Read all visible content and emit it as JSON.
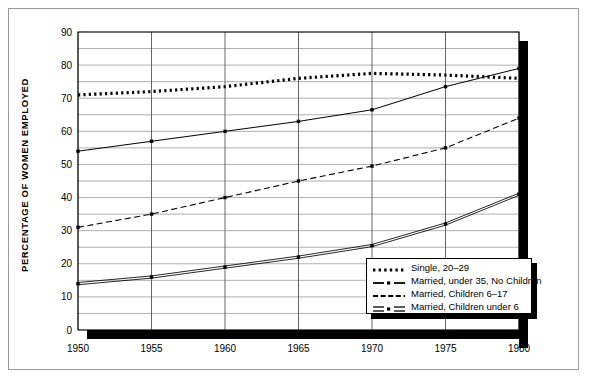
{
  "chart_data": {
    "type": "line",
    "title": "",
    "xlabel": "",
    "ylabel": "PERCENTAGE OF WOMEN EMPLOYED",
    "x": [
      1950,
      1955,
      1960,
      1965,
      1970,
      1975,
      1980
    ],
    "xlim": [
      1950,
      1980
    ],
    "ylim": [
      0,
      90
    ],
    "x_ticks": [
      "1950",
      "1955",
      "1960",
      "1965",
      "1970",
      "1975",
      "1980"
    ],
    "y_ticks": [
      "0",
      "10",
      "20",
      "30",
      "40",
      "50",
      "60",
      "70",
      "80",
      "90"
    ],
    "y_minor_step": 5,
    "grid": true,
    "legend_position": "lower-right",
    "series": [
      {
        "name": "Single, 20–29",
        "style": "dotted",
        "values": [
          71,
          72,
          73.5,
          76,
          77.5,
          77,
          76
        ]
      },
      {
        "name": "Married, under 35, No Children",
        "style": "dash-dot",
        "values": [
          54,
          57,
          60,
          63,
          66.5,
          73.5,
          79
        ]
      },
      {
        "name": "Married, Children 6–17",
        "style": "dashed",
        "values": [
          31,
          35,
          40,
          45,
          49.5,
          55,
          64
        ]
      },
      {
        "name": "Married, Children under 6",
        "style": "double-dot",
        "values": [
          14,
          16,
          19,
          22,
          25.5,
          32,
          41
        ]
      }
    ]
  },
  "legend": {
    "items": [
      {
        "label": "Single, 20–29",
        "key": "dotted"
      },
      {
        "label": "Married, under 35, No Children",
        "key": "dash-dot"
      },
      {
        "label": "Married, Children 6–17",
        "key": "dashed"
      },
      {
        "label": "Married, Children under 6",
        "key": "double-dot"
      }
    ]
  },
  "axis": {
    "y_title": "PERCENTAGE OF WOMEN EMPLOYED"
  },
  "colors": {
    "ink": "#000000",
    "grid": "#8d8d8d",
    "frame": "#9a9a9a",
    "background": "#ffffff"
  }
}
